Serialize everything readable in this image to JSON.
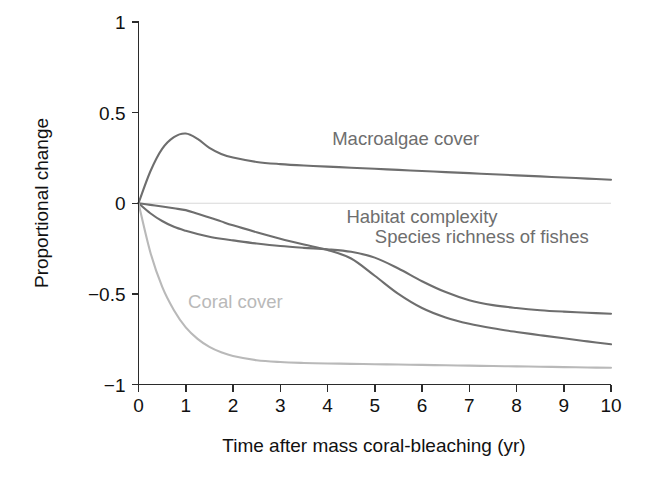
{
  "chart_data": {
    "type": "line",
    "title": "",
    "xlabel": "Time after mass coral-bleaching (yr)",
    "ylabel": "Proportional change",
    "xlim": [
      0,
      10
    ],
    "ylim": [
      -1,
      1
    ],
    "xticks": [
      "0",
      "1",
      "2",
      "3",
      "4",
      "5",
      "6",
      "7",
      "8",
      "9",
      "10"
    ],
    "yticks": [
      "1",
      "0.5",
      "0",
      "−0.5",
      "−1"
    ],
    "ytick_values": [
      1,
      0.5,
      0,
      -0.5,
      -1
    ],
    "grid": false,
    "legend_position": "inline-annotations",
    "zero_reference_line": true,
    "x": [
      0,
      0.25,
      0.5,
      0.75,
      1,
      1.25,
      1.5,
      1.75,
      2,
      2.5,
      3,
      3.5,
      4,
      4.5,
      5,
      5.5,
      6,
      6.5,
      7,
      7.5,
      8,
      8.5,
      9,
      9.5,
      10
    ],
    "series": [
      {
        "name": "Macroalgae cover",
        "color": "#6e6e6e",
        "label_x": 4.1,
        "label_y": 0.32,
        "values": [
          0.0,
          0.175,
          0.3,
          0.365,
          0.385,
          0.355,
          0.305,
          0.272,
          0.252,
          0.228,
          0.216,
          0.208,
          0.202,
          0.196,
          0.19,
          0.184,
          0.178,
          0.172,
          0.166,
          0.16,
          0.154,
          0.148,
          0.142,
          0.136,
          0.13
        ]
      },
      {
        "name": "Habitat complexity",
        "color": "#6e6e6e",
        "label_x": 4.4,
        "label_y": -0.11,
        "values": [
          0.0,
          -0.009,
          -0.018,
          -0.028,
          -0.038,
          -0.058,
          -0.078,
          -0.1,
          -0.122,
          -0.16,
          -0.196,
          -0.228,
          -0.258,
          -0.305,
          -0.4,
          -0.5,
          -0.578,
          -0.63,
          -0.665,
          -0.69,
          -0.71,
          -0.728,
          -0.745,
          -0.762,
          -0.778
        ]
      },
      {
        "name": "Species richness of fishes",
        "color": "#6e6e6e",
        "label_x": 5.0,
        "label_y": -0.22,
        "values": [
          0.0,
          -0.055,
          -0.098,
          -0.13,
          -0.152,
          -0.17,
          -0.185,
          -0.196,
          -0.205,
          -0.222,
          -0.236,
          -0.246,
          -0.254,
          -0.268,
          -0.3,
          -0.36,
          -0.43,
          -0.49,
          -0.535,
          -0.562,
          -0.578,
          -0.59,
          -0.598,
          -0.604,
          -0.61
        ]
      },
      {
        "name": "Coral cover",
        "color": "#b9b9b9",
        "label_x": 1.05,
        "label_y": -0.575,
        "values": [
          0.0,
          -0.27,
          -0.46,
          -0.59,
          -0.685,
          -0.748,
          -0.792,
          -0.822,
          -0.843,
          -0.866,
          -0.876,
          -0.881,
          -0.884,
          -0.886,
          -0.888,
          -0.89,
          -0.892,
          -0.894,
          -0.896,
          -0.898,
          -0.9,
          -0.902,
          -0.904,
          -0.906,
          -0.908
        ]
      }
    ],
    "colors": {
      "dark_series": "#6e6e6e",
      "light_series": "#b9b9b9",
      "axis": "#2b2b2b",
      "zero_line": "#d8d8d8",
      "text": "#111111",
      "background": "#ffffff"
    }
  }
}
